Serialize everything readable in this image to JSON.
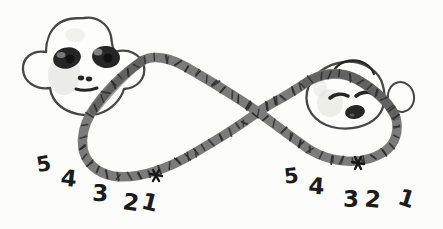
{
  "countdown": {
    "left": [
      "5",
      "4",
      "3",
      "2",
      "1"
    ],
    "right": [
      "5",
      "4",
      "3",
      "2",
      "1"
    ]
  },
  "icons": {
    "left_figure": "awake-face",
    "right_figure": "sleeping-face",
    "path_figure": "infinity-loop-band"
  },
  "colors": {
    "paper": "#fcfcfa",
    "band": "#7b7b7b",
    "tick": "#2e2e2e",
    "ink": "#474747",
    "feature": "#262626",
    "number": "#1c1c1c",
    "shading": "#d6d6d0"
  }
}
